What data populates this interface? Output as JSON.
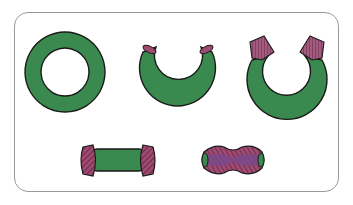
{
  "diagram": {
    "colors": {
      "body_green": "#3a8a50",
      "cap_pink": "#a04a72",
      "hatch_dark": "#4a1a30",
      "core_purple": "#7a4a8a",
      "outline": "#1a1a1a",
      "frame_border": "#9a9a9a"
    },
    "shapes": [
      {
        "id": "closed-ring",
        "label": "Closed green ring (torus)"
      },
      {
        "id": "open-ring",
        "label": "Ring opened at top, small pink cut ends"
      },
      {
        "id": "capped-ring",
        "label": "Open ring with pink hatched end caps"
      },
      {
        "id": "straight-tube",
        "label": "Straight green tube with hatched pink caps"
      },
      {
        "id": "pinched-capsule",
        "label": "Pinched capsule, pink hatched with purple core, green ends"
      }
    ]
  }
}
